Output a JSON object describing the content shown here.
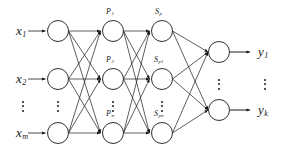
{
  "figure": {
    "type": "neural-network-diagram",
    "title": "",
    "layers": 4,
    "stroke_color": "#1a1a1a",
    "node_fill": "#ffffff",
    "background": "#ffffff"
  },
  "input_layer": {
    "name": "input-layer",
    "node_count_shown": 3,
    "labels": [
      {
        "base": "x",
        "sub": "1",
        "text": "x1"
      },
      {
        "base": "x",
        "sub": "2",
        "text": "x2"
      },
      {
        "base": "x",
        "sub": "m",
        "text": "xm"
      }
    ],
    "ellipsis": "⋮"
  },
  "p_layer": {
    "name": "p-layer",
    "node_count_shown": 3,
    "labels": [
      {
        "base": "P",
        "sub": "1",
        "text": "P1"
      },
      {
        "base": "P",
        "sub": "2",
        "text": "P2"
      },
      {
        "base": "P",
        "sub": "n",
        "text": "Pn"
      }
    ],
    "ellipsis": "⋮"
  },
  "s_layer": {
    "name": "s-layer",
    "node_count_shown": 3,
    "labels": [
      {
        "base": "S",
        "sub": "p",
        "text": "Sp"
      },
      {
        "base": "S",
        "sub": "p1",
        "text": "Sp1"
      },
      {
        "base": "S",
        "sub": "pn",
        "text": "Spn"
      }
    ],
    "ellipsis": "⋮"
  },
  "output_layer": {
    "name": "output-layer",
    "node_count_shown": 2,
    "labels": [
      {
        "base": "y",
        "sub": "1",
        "text": "y1"
      },
      {
        "base": "y",
        "sub": "k",
        "text": "yk"
      }
    ],
    "ellipsis": "⋮"
  },
  "geometry": {
    "node_radius": 10.5,
    "rows_y": [
      31,
      79,
      133
    ],
    "output_rows_y": [
      52,
      110
    ],
    "columns_x": [
      58,
      113,
      162,
      219
    ]
  }
}
